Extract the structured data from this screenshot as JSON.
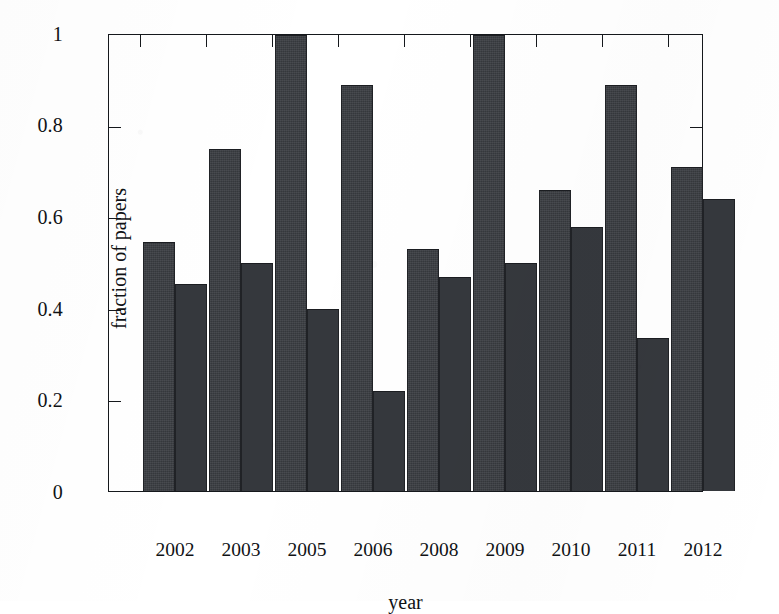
{
  "chart_data": {
    "type": "bar",
    "title": "",
    "xlabel": "year",
    "ylabel": "fraction of papers",
    "categories": [
      "2002",
      "2003",
      "2005",
      "2006",
      "2008",
      "2009",
      "2010",
      "2011",
      "2012"
    ],
    "series": [
      {
        "name": "series-a",
        "values": [
          0.545,
          0.75,
          1.0,
          0.89,
          0.53,
          1.0,
          0.66,
          0.89,
          0.71
        ]
      },
      {
        "name": "series-b",
        "values": [
          0.455,
          0.5,
          0.4,
          0.22,
          0.47,
          0.5,
          0.58,
          0.335,
          0.64
        ]
      }
    ],
    "ylim": [
      0,
      1
    ],
    "yticks": [
      0,
      0.2,
      0.4,
      0.6,
      0.8,
      1
    ],
    "ytick_labels": [
      "0",
      "0.2",
      "0.4",
      "0.6",
      "0.8",
      "1"
    ],
    "xtick_labels": [
      "2002",
      "2003",
      "2005",
      "2006",
      "2008",
      "2009",
      "2010",
      "2011",
      "2012"
    ],
    "grid": false,
    "legend": "none",
    "bar_color": "#3a3d42",
    "axis_color": "#15181c",
    "background": "#ffffff"
  },
  "axes": {
    "y_label": "fraction of papers",
    "x_label": "year"
  }
}
